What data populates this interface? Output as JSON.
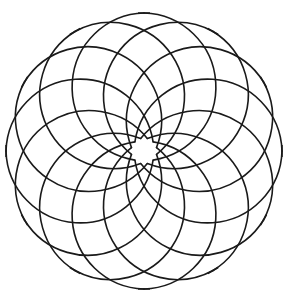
{
  "figure": {
    "title": "",
    "type": "rosette line drawing",
    "points": 12,
    "stroke_color": "#1a1a1a",
    "background": "#ffffff"
  },
  "geometry": {
    "center": [
      144,
      151
    ],
    "outer_radius": 138,
    "inner_radius": 13,
    "arc_radius": 74,
    "start_angle_deg": -90
  }
}
